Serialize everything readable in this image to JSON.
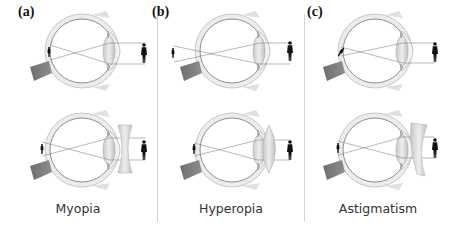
{
  "figure": {
    "panels": [
      {
        "id": "a",
        "label": "(a)",
        "caption": "Myopia",
        "correction_lens": "concave (diverging)"
      },
      {
        "id": "b",
        "label": "(b)",
        "caption": "Hyperopia",
        "correction_lens": "convex (converging)"
      },
      {
        "id": "c",
        "label": "(c)",
        "caption": "Astigmatism",
        "correction_lens": "cylindrical"
      }
    ]
  },
  "icons": {
    "eye": "eye-cross-section-icon",
    "person": "person-silhouette-icon",
    "concave_lens": "concave-lens-icon",
    "convex_lens": "convex-lens-icon",
    "cylindrical_lens": "cylindrical-lens-icon"
  },
  "colors": {
    "eye_wall": "#e6e6e6",
    "eye_outline": "#9a9a9a",
    "optic_nerve": "#7a7a7a",
    "lens": "#d8d8d8",
    "ray": "#8a8a8a",
    "figure": "#111111",
    "divider": "#d4d4d4"
  }
}
